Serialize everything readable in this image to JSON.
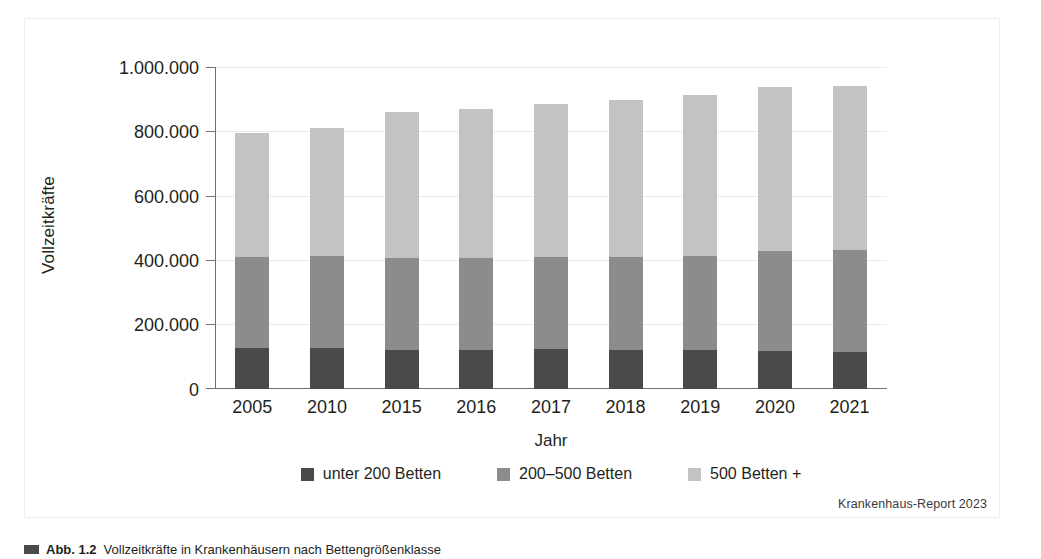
{
  "figure": {
    "source_note": "Krankenhaus-Report 2023",
    "caption_label": "Abb. 1.2",
    "caption_text": "Vollzeitkräfte in Krankenhäusern nach Bettengrößenklasse"
  },
  "colors": {
    "series_dark": "#4a4a4a",
    "series_medium": "#8c8c8c",
    "series_light": "#c3c3c3",
    "axis": "#6f6f6f",
    "grid": "#eceaea",
    "frame": "#ededed",
    "text": "#231f20"
  },
  "chart_data": {
    "type": "bar",
    "stacked": true,
    "title": "",
    "xlabel": "Jahr",
    "ylabel": "Vollzeitkräfte",
    "categories": [
      "2005",
      "2010",
      "2015",
      "2016",
      "2017",
      "2018",
      "2019",
      "2020",
      "2021"
    ],
    "ytick_labels": [
      "1.000.000",
      "800.000",
      "600.000",
      "400.000",
      "200.000",
      "0"
    ],
    "ytick_values": [
      1000000,
      800000,
      600000,
      400000,
      200000,
      0
    ],
    "ylim": [
      0,
      1000000
    ],
    "grid": true,
    "legend_position": "bottom",
    "series": [
      {
        "name": "unter 200 Betten",
        "color": "#4a4a4a",
        "values": [
          126000,
          126000,
          122000,
          122000,
          125000,
          121000,
          121000,
          119000,
          115000
        ]
      },
      {
        "name": "200–500 Betten",
        "color": "#8c8c8c",
        "values": [
          283000,
          288000,
          285000,
          285000,
          284000,
          289000,
          291000,
          311000,
          317000
        ]
      },
      {
        "name": "500 Betten +",
        "color": "#c3c3c3",
        "values": [
          386000,
          398000,
          453000,
          464000,
          476000,
          487000,
          502000,
          508000,
          509000
        ]
      }
    ],
    "totals": [
      795000,
      812000,
      860000,
      871000,
      885000,
      897000,
      914000,
      938000,
      941000
    ]
  }
}
